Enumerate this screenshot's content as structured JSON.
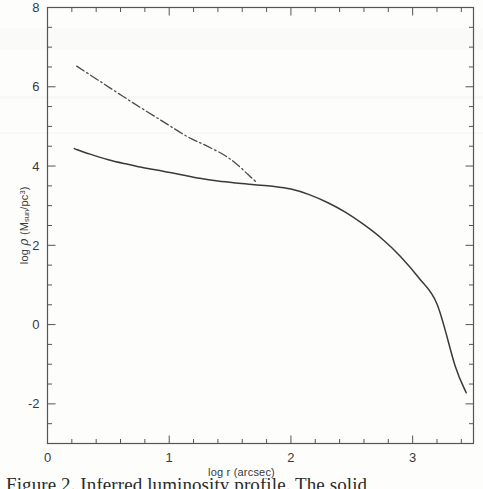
{
  "figure": {
    "caption": "Figure 2. Inferred luminosity profile. The solid"
  },
  "chart_data": {
    "type": "line",
    "title": "",
    "xlabel": "log r (arcsec)",
    "ylabel": "log ρ (M_sun/pc^3)",
    "xlabel_parts": {
      "pre": "log r (arcsec)"
    },
    "ylabel_parts": {
      "pre": "log ",
      "symbol": "ρ",
      "mid": " (M",
      "sub": "sun",
      "slash": "/pc",
      "sup": "3",
      "post": ")"
    },
    "xlim": [
      0,
      3.5
    ],
    "ylim": [
      -3,
      8
    ],
    "x_major_ticks": [
      0,
      1,
      2,
      3
    ],
    "x_major_tick_labels": [
      "0",
      "1",
      "2",
      "3"
    ],
    "x_minor_step": 0.2,
    "y_major_ticks": [
      -2,
      0,
      2,
      4,
      6,
      8
    ],
    "y_major_tick_labels": [
      "-2",
      "0",
      "2",
      "4",
      "6",
      "8"
    ],
    "y_minor_step": 0.5,
    "grid": false,
    "legend_position": "none",
    "series": [
      {
        "name": "total density profile",
        "style": "solid",
        "color": "#3a3a3a",
        "x": [
          0.22,
          0.35,
          0.5,
          0.65,
          0.8,
          0.95,
          1.1,
          1.25,
          1.4,
          1.55,
          1.7,
          1.85,
          2.0,
          2.15,
          2.3,
          2.45,
          2.6,
          2.75,
          2.9,
          3.05,
          3.2,
          3.35,
          3.44
        ],
        "y": [
          4.44,
          4.3,
          4.16,
          4.05,
          3.95,
          3.87,
          3.78,
          3.69,
          3.62,
          3.57,
          3.53,
          3.49,
          3.42,
          3.28,
          3.08,
          2.83,
          2.52,
          2.16,
          1.72,
          1.18,
          0.52,
          -1.05,
          -1.72
        ]
      },
      {
        "name": "stellar density profile",
        "style": "dash-dot",
        "color": "#4a4a4a",
        "x": [
          0.24,
          0.45,
          0.7,
          0.95,
          1.15,
          1.3,
          1.45,
          1.55,
          1.65,
          1.72
        ],
        "y": [
          6.52,
          6.1,
          5.6,
          5.12,
          4.74,
          4.52,
          4.28,
          4.06,
          3.78,
          3.58
        ]
      }
    ]
  }
}
